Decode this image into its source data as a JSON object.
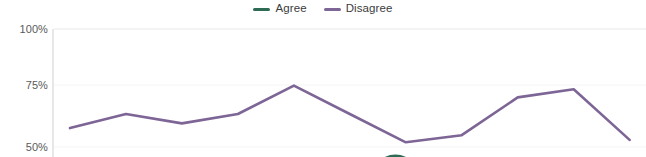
{
  "legend": {
    "position": "top-center",
    "entries": [
      {
        "label": "Agree",
        "color": "#2e6b55",
        "swatch_name": "legend-swatch-agree"
      },
      {
        "label": "Disagree",
        "color": "#7d6596",
        "swatch_name": "legend-swatch-disagree"
      }
    ]
  },
  "axis": {
    "y_ticks": [
      {
        "label": "100%",
        "value": 100
      },
      {
        "label": "75%",
        "value": 75
      },
      {
        "label": "50%",
        "value": 50
      }
    ]
  },
  "colors": {
    "agree": "#2e6b55",
    "disagree": "#7d6596",
    "gridline": "#f0f0f2",
    "axis": "#e2e2e5",
    "label_text": "#5a5a5a",
    "legend_text": "#3c3c3c",
    "background": "#ffffff"
  },
  "chart_data": {
    "type": "line",
    "title": "",
    "subtitle": "",
    "xlabel": "",
    "ylabel": "",
    "ylim": [
      50,
      100
    ],
    "ytick_values": [
      100,
      75,
      50
    ],
    "ytick_labels": [
      "100%",
      "75%",
      "50%"
    ],
    "grid": true,
    "legend_position": "top-center",
    "note": "Cropped view: only the Disagree series is inside the visible plot range; the Agree series sits below 50% and only its topmost curve clips into the bottom edge near the middle of the chart.",
    "x": [
      1,
      2,
      3,
      4,
      5,
      6,
      7,
      8,
      9,
      10,
      11
    ],
    "series": [
      {
        "name": "Disagree",
        "color": "#7d6596",
        "values": [
          58,
          64,
          60,
          64,
          76,
          64,
          52,
          55,
          71,
          74.5,
          53
        ]
      },
      {
        "name": "Agree",
        "color": "#2e6b55",
        "values": [
          null,
          null,
          null,
          null,
          null,
          null,
          49,
          null,
          null,
          null,
          null
        ],
        "visible_in_crop": "partial"
      }
    ]
  }
}
